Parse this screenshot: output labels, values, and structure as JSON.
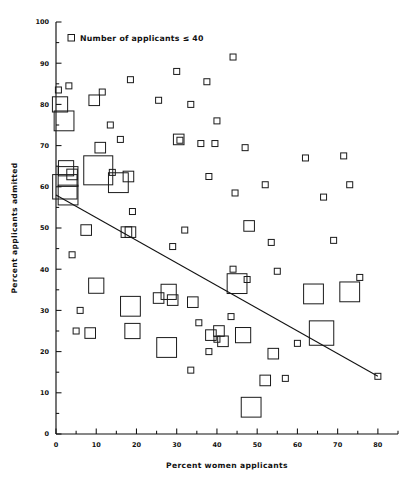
{
  "chart_data": {
    "type": "scatter",
    "title": "",
    "xlabel": "Percent women applicants",
    "ylabel": "Percent applicants admitted",
    "xlim": [
      0,
      85
    ],
    "ylim": [
      0,
      100
    ],
    "xticks": [
      0,
      10,
      20,
      30,
      40,
      50,
      60,
      70,
      80
    ],
    "yticks": [
      0,
      10,
      20,
      30,
      40,
      50,
      60,
      70,
      80,
      90,
      100
    ],
    "xtick_labels": [
      "0",
      "10",
      "20",
      "30",
      "40",
      "50",
      "60",
      "70",
      "80"
    ],
    "ytick_labels": [
      "0",
      "10",
      "20",
      "30",
      "40",
      "50",
      "60",
      "70",
      "80",
      "90",
      "100"
    ],
    "minor_tick_step": 5,
    "grid": false,
    "legend": {
      "position": "top-left",
      "entries": [
        {
          "marker": "small-open-square",
          "label": "Number of applicants ≤ 40"
        }
      ]
    },
    "marker_encoding": {
      "shape": "open square",
      "size_meaning": "square side scales with number of applicants; smallest square = 40 or fewer applicants"
    },
    "annotations": [],
    "trendline": {
      "type": "linear fit",
      "x_start": 0,
      "y_start": 58,
      "x_end": 80,
      "y_end": 14
    },
    "points": [
      {
        "x": 0.6,
        "y": 83.5,
        "size": 1
      },
      {
        "x": 1.0,
        "y": 80.0,
        "size": 3
      },
      {
        "x": 2.0,
        "y": 76.0,
        "size": 4
      },
      {
        "x": 3.2,
        "y": 84.5,
        "size": 1
      },
      {
        "x": 11.5,
        "y": 83.0,
        "size": 1
      },
      {
        "x": 18.5,
        "y": 86.0,
        "size": 1
      },
      {
        "x": 30.0,
        "y": 88.0,
        "size": 1
      },
      {
        "x": 37.5,
        "y": 85.5,
        "size": 1
      },
      {
        "x": 44.0,
        "y": 91.5,
        "size": 1
      },
      {
        "x": 25.5,
        "y": 81.0,
        "size": 1
      },
      {
        "x": 9.5,
        "y": 81.0,
        "size": 2
      },
      {
        "x": 13.5,
        "y": 75.0,
        "size": 1
      },
      {
        "x": 16.0,
        "y": 71.5,
        "size": 1
      },
      {
        "x": 11.0,
        "y": 69.5,
        "size": 2
      },
      {
        "x": 33.5,
        "y": 80.0,
        "size": 1
      },
      {
        "x": 40.0,
        "y": 76.0,
        "size": 1
      },
      {
        "x": 2.5,
        "y": 64.5,
        "size": 3
      },
      {
        "x": 3.0,
        "y": 62.5,
        "size": 4
      },
      {
        "x": 4.0,
        "y": 63.0,
        "size": 2
      },
      {
        "x": 2.2,
        "y": 60.0,
        "size": 5
      },
      {
        "x": 3.0,
        "y": 58.0,
        "size": 4
      },
      {
        "x": 10.5,
        "y": 64.0,
        "size": 6
      },
      {
        "x": 14.0,
        "y": 63.5,
        "size": 1
      },
      {
        "x": 15.5,
        "y": 61.0,
        "size": 4
      },
      {
        "x": 18.0,
        "y": 62.5,
        "size": 2
      },
      {
        "x": 30.5,
        "y": 71.5,
        "size": 2
      },
      {
        "x": 30.8,
        "y": 71.3,
        "size": 1
      },
      {
        "x": 36.0,
        "y": 70.5,
        "size": 1
      },
      {
        "x": 39.5,
        "y": 70.5,
        "size": 1
      },
      {
        "x": 47.0,
        "y": 69.5,
        "size": 1
      },
      {
        "x": 38.0,
        "y": 62.5,
        "size": 1
      },
      {
        "x": 52.0,
        "y": 60.5,
        "size": 1
      },
      {
        "x": 62.0,
        "y": 67.0,
        "size": 1
      },
      {
        "x": 71.5,
        "y": 67.5,
        "size": 1
      },
      {
        "x": 73.0,
        "y": 60.5,
        "size": 1
      },
      {
        "x": 44.5,
        "y": 58.5,
        "size": 1
      },
      {
        "x": 66.5,
        "y": 57.5,
        "size": 1
      },
      {
        "x": 19.0,
        "y": 54.0,
        "size": 1
      },
      {
        "x": 7.5,
        "y": 49.5,
        "size": 2
      },
      {
        "x": 17.5,
        "y": 49.0,
        "size": 2
      },
      {
        "x": 18.5,
        "y": 49.0,
        "size": 2
      },
      {
        "x": 32.0,
        "y": 49.5,
        "size": 1
      },
      {
        "x": 48.0,
        "y": 50.5,
        "size": 2
      },
      {
        "x": 53.5,
        "y": 46.5,
        "size": 1
      },
      {
        "x": 69.0,
        "y": 47.0,
        "size": 1
      },
      {
        "x": 4.0,
        "y": 43.5,
        "size": 1
      },
      {
        "x": 29.0,
        "y": 45.5,
        "size": 1
      },
      {
        "x": 44.0,
        "y": 40.0,
        "size": 1
      },
      {
        "x": 10.0,
        "y": 36.0,
        "size": 3
      },
      {
        "x": 6.0,
        "y": 30.0,
        "size": 1
      },
      {
        "x": 18.5,
        "y": 31.0,
        "size": 4
      },
      {
        "x": 25.5,
        "y": 33.0,
        "size": 2
      },
      {
        "x": 28.0,
        "y": 34.5,
        "size": 3
      },
      {
        "x": 29.0,
        "y": 32.5,
        "size": 2
      },
      {
        "x": 34.0,
        "y": 32.0,
        "size": 2
      },
      {
        "x": 45.0,
        "y": 36.5,
        "size": 4
      },
      {
        "x": 47.5,
        "y": 37.5,
        "size": 1
      },
      {
        "x": 64.0,
        "y": 34.0,
        "size": 4
      },
      {
        "x": 73.0,
        "y": 34.5,
        "size": 4
      },
      {
        "x": 75.5,
        "y": 38.0,
        "size": 1
      },
      {
        "x": 55.0,
        "y": 39.5,
        "size": 1
      },
      {
        "x": 5.0,
        "y": 25.0,
        "size": 1
      },
      {
        "x": 8.5,
        "y": 24.5,
        "size": 2
      },
      {
        "x": 19.0,
        "y": 25.0,
        "size": 3
      },
      {
        "x": 27.5,
        "y": 21.0,
        "size": 4
      },
      {
        "x": 35.5,
        "y": 27.0,
        "size": 1
      },
      {
        "x": 38.5,
        "y": 24.0,
        "size": 2
      },
      {
        "x": 40.5,
        "y": 25.0,
        "size": 2
      },
      {
        "x": 40.0,
        "y": 23.0,
        "size": 1
      },
      {
        "x": 41.5,
        "y": 22.5,
        "size": 2
      },
      {
        "x": 46.5,
        "y": 24.0,
        "size": 3
      },
      {
        "x": 43.5,
        "y": 28.5,
        "size": 1
      },
      {
        "x": 66.0,
        "y": 24.5,
        "size": 5
      },
      {
        "x": 38.0,
        "y": 20.0,
        "size": 1
      },
      {
        "x": 54.0,
        "y": 19.5,
        "size": 2
      },
      {
        "x": 60.0,
        "y": 22.0,
        "size": 1
      },
      {
        "x": 52.0,
        "y": 13.0,
        "size": 2
      },
      {
        "x": 33.5,
        "y": 15.5,
        "size": 1
      },
      {
        "x": 48.5,
        "y": 6.5,
        "size": 4
      },
      {
        "x": 57.0,
        "y": 13.5,
        "size": 1
      },
      {
        "x": 80.0,
        "y": 14.0,
        "size": 1
      }
    ]
  },
  "legend": {
    "label": "Number of applicants ≤ 40"
  },
  "axes": {
    "x_title": "Percent women applicants",
    "y_title": "Percent applicants admitted"
  }
}
